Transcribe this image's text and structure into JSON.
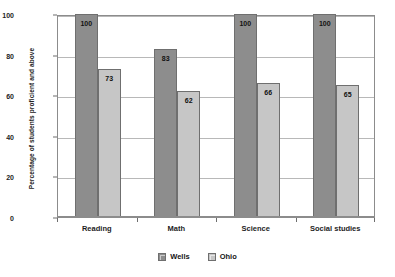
{
  "chart_data": {
    "type": "bar",
    "title": "",
    "xlabel": "",
    "ylabel": "Percentage of students proficient and above",
    "categories": [
      "Reading",
      "Math",
      "Science",
      "Social studies"
    ],
    "series": [
      {
        "name": "Wells",
        "color": "#8d8d8d",
        "values": [
          100,
          83,
          100,
          100
        ]
      },
      {
        "name": "Ohio",
        "color": "#c6c6c6",
        "values": [
          73,
          62,
          66,
          65
        ]
      }
    ],
    "ylim": [
      0,
      100
    ],
    "yticks": [
      0,
      20,
      40,
      60,
      80,
      100
    ],
    "ytick_labels": [
      "0",
      "20",
      "40",
      "60",
      "80",
      "100"
    ],
    "grid": true,
    "grid_axis": "y",
    "legend_position": "bottom-center",
    "data_labels": true,
    "data_label_position": "inside-top"
  },
  "legend": {
    "items": [
      {
        "label": "Wells",
        "swatch": "wells-swatch"
      },
      {
        "label": "Ohio",
        "swatch": "ohio-swatch"
      }
    ]
  }
}
